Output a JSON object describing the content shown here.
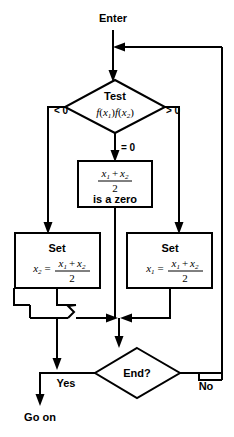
{
  "diagram": {
    "background_color": "#ffffff",
    "line_color": "#000000",
    "entry_label": "Enter",
    "exit_label": "Go on",
    "nodes": {
      "test": {
        "shape": "diamond",
        "line1": "Test",
        "line2_fn": "f",
        "line2_arg1_var": "x",
        "line2_arg1_sub": "1",
        "line2_mid": ")",
        "line2_fn2": "f",
        "line2_arg2_var": "x",
        "line2_arg2_sub": "2"
      },
      "zero_box": {
        "shape": "rect",
        "numerator_x1": "x",
        "numerator_x1_sub": "1",
        "numerator_plus": "+",
        "numerator_x2": "x",
        "numerator_x2_sub": "2",
        "denominator": "2",
        "caption": "is a zero"
      },
      "set_left": {
        "shape": "rect",
        "title": "Set",
        "lhs_var": "x",
        "lhs_sub": "2",
        "equals": "=",
        "numerator_x1": "x",
        "numerator_x1_sub": "1",
        "numerator_plus": "+",
        "numerator_x2": "x",
        "numerator_x2_sub": "2",
        "denominator": "2"
      },
      "set_right": {
        "shape": "rect",
        "title": "Set",
        "lhs_var": "x",
        "lhs_sub": "1",
        "equals": "=",
        "numerator_x1": "x",
        "numerator_x1_sub": "1",
        "numerator_plus": "+",
        "numerator_x2": "x",
        "numerator_x2_sub": "2",
        "denominator": "2"
      },
      "end": {
        "shape": "diamond",
        "label": "End?"
      }
    },
    "branch_labels": {
      "test_less_than": "< 0",
      "test_equals": "= 0",
      "test_greater_than": "> 0",
      "end_yes": "Yes",
      "end_no": "No"
    }
  }
}
